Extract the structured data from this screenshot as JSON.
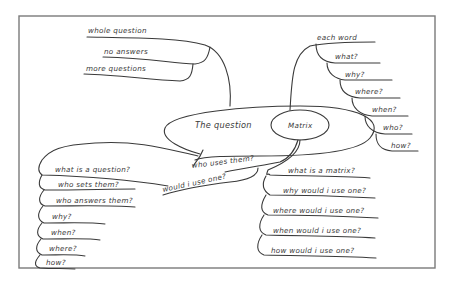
{
  "diagram": {
    "type": "mind-map",
    "style": "hand-drawn",
    "colors": {
      "line": "#3a3a3a",
      "frame": "#7a7a7a",
      "background": "#ffffff"
    },
    "center": {
      "label": "The question"
    },
    "sub_center": {
      "label": "Matrix"
    },
    "branches": {
      "top_left": {
        "items": [
          "whole question",
          "no answers",
          "more questions"
        ]
      },
      "top_right": {
        "items": [
          "each word",
          "what?",
          "why?",
          "where?",
          "when?",
          "who?",
          "how?"
        ]
      },
      "bottom_middle": {
        "items": [
          "who uses them?",
          "would i use one?"
        ]
      },
      "bottom_left": {
        "items": [
          "what is a question?",
          "who sets them?",
          "who answers them?",
          "why?",
          "when?",
          "where?",
          "how?"
        ]
      },
      "bottom_right": {
        "items": [
          "what is a matrix?",
          "why would i use one?",
          "where would i use one?",
          "when would i use one?",
          "how would i use one?"
        ]
      }
    }
  }
}
